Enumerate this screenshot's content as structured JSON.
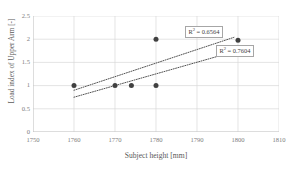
{
  "chart_data": {
    "type": "scatter",
    "title": "",
    "xlabel": "Subject height [mm]",
    "ylabel": "Load index of Upper Arm [-]",
    "xlim": [
      1750,
      1810
    ],
    "ylim": [
      0,
      2.5
    ],
    "xticks": [
      1750,
      1760,
      1770,
      1780,
      1790,
      1800,
      1810
    ],
    "yticks": [
      0,
      0.5,
      1,
      1.5,
      2,
      2.5
    ],
    "xtick_labels": [
      "1750",
      "1760",
      "1770",
      "1780",
      "1790",
      "1800",
      "1810"
    ],
    "ytick_labels": [
      "0",
      "0.5",
      "1",
      "1.5",
      "2",
      "2.5"
    ],
    "grid": true,
    "legend": "none",
    "series": [
      {
        "name": "Data points",
        "marker": "circle",
        "color": "#404040",
        "points": [
          {
            "x": 1760,
            "y": 1
          },
          {
            "x": 1770,
            "y": 1
          },
          {
            "x": 1774,
            "y": 1
          },
          {
            "x": 1780,
            "y": 1
          },
          {
            "x": 1780,
            "y": 2
          },
          {
            "x": 1800,
            "y": 1.98
          }
        ]
      }
    ],
    "trendlines": [
      {
        "name": "upper-trendline",
        "style": "dotted",
        "color": "#404040",
        "x_start": 1760,
        "y_start": 0.9,
        "x_end": 1799,
        "y_end": 2.04,
        "r_squared": "0.6564",
        "label": "R² = 0.6564"
      },
      {
        "name": "lower-trendline",
        "style": "dotted",
        "color": "#404040",
        "x_start": 1760,
        "y_start": 0.75,
        "x_end": 1801,
        "y_end": 1.78,
        "r_squared": "0.7604",
        "label": "R² = 0.7604"
      }
    ],
    "annotations": [
      {
        "name": "r2-upper",
        "prefix": "R",
        "sup": "2",
        "suffix": " = 0.6564"
      },
      {
        "name": "r2-lower",
        "prefix": "R",
        "sup": "2",
        "suffix": " = 0.7604"
      }
    ],
    "colors": {
      "marker": "#404040",
      "trendline": "#404040",
      "gridline": "#d9d9d9",
      "axis": "#bfbfbf",
      "text": "#808080",
      "title_text": "#595959",
      "annotation_border": "#a6a6a6",
      "background": "#ffffff"
    }
  }
}
